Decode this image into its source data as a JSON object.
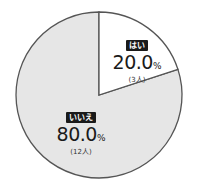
{
  "chart_data": {
    "type": "pie",
    "title": "",
    "categories": [
      "はい",
      "いいえ"
    ],
    "values": [
      20.0,
      80.0
    ],
    "counts": [
      3,
      12
    ],
    "value_unit": "%",
    "colors": [
      "#ffffff",
      "#e6e6e6"
    ],
    "start_angle_deg": 0,
    "direction": "clockwise",
    "legend": "none (inline labels)"
  },
  "labels": {
    "yes": {
      "tag": "はい",
      "pct": "20.0",
      "unit": "%",
      "count": "(3人)"
    },
    "no": {
      "tag": "いいえ",
      "pct": "80.0",
      "unit": "%",
      "count": "(12人)"
    }
  },
  "style": {
    "stroke": "#555555",
    "yes_fill": "#ffffff",
    "no_fill": "#e6e6e6"
  }
}
